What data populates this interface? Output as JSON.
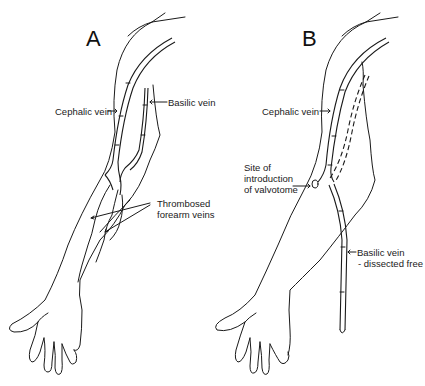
{
  "panels": [
    {
      "id": "A",
      "letter": "A",
      "labels": {
        "cephalic": "Cephalic vein",
        "basilic": "Basilic vein",
        "thrombosed_1": "Thrombosed",
        "thrombosed_2": "forearm veins"
      }
    },
    {
      "id": "B",
      "letter": "B",
      "labels": {
        "cephalic": "Cephalic vein",
        "site_1": "Site of",
        "site_2": "introduction",
        "site_3": "of valvotome",
        "basilic_1": "Basilic vein",
        "basilic_2": "- dissected free"
      }
    }
  ],
  "colors": {
    "line": "#1a1a1a",
    "background": "#ffffff"
  }
}
